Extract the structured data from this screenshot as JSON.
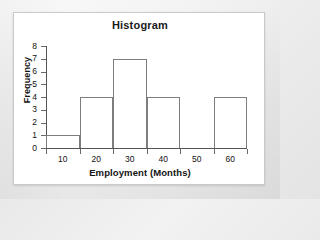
{
  "chart_data": {
    "type": "bar",
    "title": "Histogram",
    "xlabel": "Employment (Months)",
    "ylabel": "Frequency",
    "bin_width": 10,
    "bins": [
      {
        "start": 5,
        "end": 15,
        "value": 1
      },
      {
        "start": 15,
        "end": 25,
        "value": 4
      },
      {
        "start": 25,
        "end": 35,
        "value": 7
      },
      {
        "start": 35,
        "end": 45,
        "value": 4
      },
      {
        "start": 45,
        "end": 55,
        "value": 0
      },
      {
        "start": 55,
        "end": 65,
        "value": 4
      }
    ],
    "values": [
      1,
      4,
      7,
      4,
      0,
      4
    ],
    "categories": [
      "5-15",
      "15-25",
      "25-35",
      "35-45",
      "45-55",
      "55-65"
    ],
    "x_ticks": [
      5,
      15,
      25,
      35,
      45,
      55,
      65
    ],
    "x_tick_labels": [
      "10",
      "20",
      "30",
      "40",
      "50",
      "60"
    ],
    "x_tick_label_positions": [
      10,
      20,
      30,
      40,
      50,
      60
    ],
    "y_ticks": [
      0,
      1,
      2,
      3,
      4,
      5,
      6,
      7,
      8
    ],
    "y_tick_labels": [
      "0",
      "1",
      "2",
      "3",
      "4",
      "5",
      "6",
      "7",
      "8"
    ],
    "xlim": [
      5,
      65
    ],
    "ylim": [
      0,
      8
    ],
    "grid": false,
    "legend": null,
    "bar_fill_color": "#ffffff",
    "bar_border_color": "#7d7d7d",
    "axis_color": "#555555",
    "panel_background": "#ffffff",
    "page_background": "#ececec"
  }
}
